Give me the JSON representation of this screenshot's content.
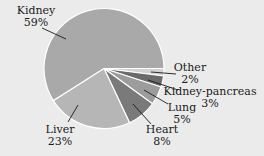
{
  "chart_data": {
    "type": "pie",
    "title": "",
    "slices": [
      {
        "label": "Kidney",
        "pct_label": "59%",
        "value": 59,
        "color": "#a9a9a9"
      },
      {
        "label": "Other",
        "pct_label": "2%",
        "value": 2,
        "color": "#d2d2d2"
      },
      {
        "label": "Kidney-pancreas",
        "pct_label": "3%",
        "value": 3,
        "color": "#6b6b6b"
      },
      {
        "label": "Lung",
        "pct_label": "5%",
        "value": 5,
        "color": "#9c9c9c"
      },
      {
        "label": "Heart",
        "pct_label": "8%",
        "value": 8,
        "color": "#7a7a7a"
      },
      {
        "label": "Liver",
        "pct_label": "23%",
        "value": 23,
        "color": "#b6b6b6"
      }
    ],
    "background": "#ebebeb",
    "separator_color": "#ffffff"
  }
}
